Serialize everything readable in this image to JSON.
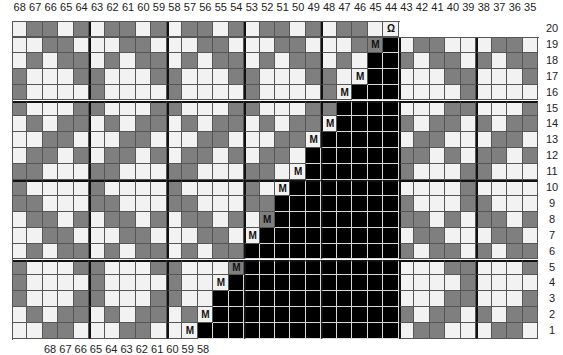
{
  "chart_data": {
    "type": "table",
    "column_numbers": [
      68,
      67,
      66,
      65,
      64,
      63,
      62,
      61,
      60,
      59,
      58,
      57,
      56,
      55,
      54,
      53,
      52,
      51,
      50,
      49,
      48,
      47,
      46,
      45,
      44,
      43,
      42,
      41,
      40,
      39,
      38,
      37,
      36,
      35
    ],
    "row_numbers": [
      20,
      19,
      18,
      17,
      16,
      15,
      14,
      13,
      12,
      11,
      10,
      9,
      8,
      7,
      6,
      5,
      4,
      3,
      2,
      1
    ],
    "legend": {
      "W": "light square (#f2f2f2)",
      "G": "gray square (#7f7f7f)",
      "B": "black square / no stitch",
      "M": "decrease symbol 'M'",
      "Q": "loop symbol at row 20 col 44"
    },
    "left_motif_cols_68_to_64": {
      "20": "WGGWG",
      "19": "WWGGW",
      "18": "WGWGG",
      "17": "GWWWG",
      "16": "GWWWW",
      "15": "GWWWG",
      "14": "WGWGG",
      "13": "WWGGW",
      "12": "WGGWG",
      "11": "GGWWW",
      "10": "GWWWW",
      "9": "GGWWW",
      "8": "WGGWG",
      "7": "WWGGW",
      "6": "WGWGG",
      "5": "GWWWG",
      "4": "GWWWW",
      "3": "GWWWG",
      "2": "WGWGG",
      "1": "WWGGW"
    },
    "right_block_cols_43_to_35": {
      "20": "",
      "19": "WGGWWWGGW",
      "18": "GWGGWGWGG",
      "17": "WWWGGWWWG",
      "16": "WWWWGWWWW",
      "15": "WWWGGWWWG",
      "14": "GWGGWGWGG",
      "13": "WGGWWWGGW",
      "12": "GGWGWGGWG",
      "11": "GWWWGGWWW",
      "10": "WWWWGWWWW",
      "9": "GWWWGGWWW",
      "8": "GGWGWGGWG",
      "7": "WGGWWWGGW",
      "6": "GWGGWGWGG",
      "5": "WWWGGWWWG",
      "4": "WWWWGWWWW",
      "3": "WWWGGWWWG",
      "2": "GWGGWGWGG",
      "1": "WGGWWWGGW"
    },
    "decrease_symbols": [
      {
        "row": 19,
        "col": 45
      },
      {
        "row": 17,
        "col": 46
      },
      {
        "row": 16,
        "col": 47
      },
      {
        "row": 14,
        "col": 48
      },
      {
        "row": 13,
        "col": 49
      },
      {
        "row": 11,
        "col": 50
      },
      {
        "row": 10,
        "col": 51
      },
      {
        "row": 8,
        "col": 52
      },
      {
        "row": 7,
        "col": 53
      },
      {
        "row": 5,
        "col": 54
      },
      {
        "row": 4,
        "col": 55
      },
      {
        "row": 2,
        "col": 56
      },
      {
        "row": 1,
        "col": 57
      }
    ],
    "black_start_col_by_row": {
      "20": null,
      "19": 44,
      "18": 45,
      "17": 45,
      "16": 46,
      "15": 47,
      "14": 47,
      "13": 48,
      "12": 49,
      "11": 49,
      "10": 50,
      "9": 51,
      "8": 51,
      "7": 52,
      "6": 53,
      "5": 53,
      "4": 54,
      "3": 55,
      "2": 55,
      "1": 56
    },
    "loop_symbol": {
      "row": 20,
      "col": 44,
      "glyph": "Ջ"
    }
  },
  "labels": {
    "decrease_glyph": "M",
    "loop_glyph": "Ω",
    "bottom_partial_text": "68 67 66 65 64 63 62 61 60 59 58"
  },
  "colors": {
    "light": "#f2f2f2",
    "gray": "#7f7f7f",
    "black": "#000000"
  }
}
